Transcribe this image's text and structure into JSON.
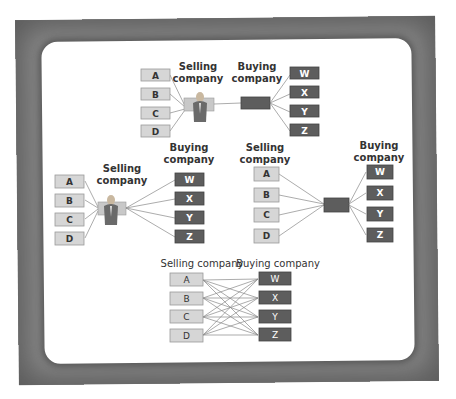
{
  "colors": {
    "frame": "#8a8a8a",
    "panel": "#ffffff",
    "seller_box": "#d6d6d6",
    "buyer_box": "#5d5d5d",
    "hub_box": "#5d5d5d",
    "line": "#888888"
  },
  "sellers": [
    "A",
    "B",
    "C",
    "D"
  ],
  "buyers": [
    "W",
    "X",
    "Y",
    "Z"
  ],
  "diagrams": [
    {
      "id": "top",
      "description": "Sellers connect to a selling-company hub (person icon), linked to a buying-company hub, which connects to buyers",
      "selling_label": [
        "Selling",
        "company"
      ],
      "buying_label": [
        "Buying",
        "company"
      ]
    },
    {
      "id": "middle-left",
      "description": "Sellers connect to selling-company hub (person icon), which connects directly to buyers",
      "selling_label": [
        "Selling",
        "company"
      ],
      "buying_label": [
        "Buying",
        "company"
      ]
    },
    {
      "id": "middle-right",
      "description": "Sellers connect to a buying-company hub, which connects to buyers",
      "selling_label": [
        "Selling",
        "company"
      ],
      "buying_label": [
        "Buying",
        "company"
      ]
    },
    {
      "id": "bottom",
      "description": "Every seller connects directly to every buyer (many-to-many)",
      "selling_label": [
        "Selling company"
      ],
      "buying_label": [
        "Buying company"
      ]
    }
  ],
  "icons": {
    "hub_person": "person-icon"
  }
}
